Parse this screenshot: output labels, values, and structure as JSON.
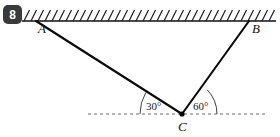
{
  "figure": {
    "problem_number": "8",
    "points": {
      "a": {
        "label": "A",
        "x": 36,
        "y": 21,
        "label_x": 38,
        "label_y": 33
      },
      "b": {
        "label": "B",
        "x": 249,
        "y": 21,
        "label_x": 252,
        "label_y": 33
      },
      "c": {
        "label": "C",
        "x": 182,
        "y": 114,
        "label_x": 178,
        "label_y": 131
      }
    },
    "angles": [
      {
        "name": "angle-left",
        "value": "30°",
        "x": 146,
        "y": 110,
        "arc_radius": 42
      },
      {
        "name": "angle-right",
        "value": "60°",
        "x": 193,
        "y": 110,
        "arc_radius": 35
      }
    ],
    "ceiling": {
      "name": "hatched-ceiling-line",
      "y": 21,
      "x_start": 22,
      "x_end": 276,
      "hatch_count": 36,
      "hatch_spacing": 7,
      "hatch_length": 11
    },
    "baseline": {
      "name": "dashed-horizontal-reference",
      "y": 114,
      "x_start": 88,
      "x_end": 266
    },
    "colors": {
      "ink": "#111111",
      "badge_bg": "#3a3a3a",
      "badge_fg": "#ffffff",
      "dash": "#6a6a6a",
      "background": "#ffffff"
    }
  }
}
